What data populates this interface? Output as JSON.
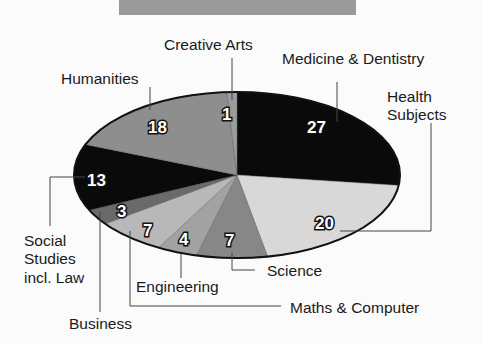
{
  "chart_data": {
    "type": "pie",
    "title": "",
    "units": "",
    "slices": [
      {
        "label": "Medicine & Dentistry",
        "value": 27,
        "color": "#0a0a0a"
      },
      {
        "label": "Health Subjects",
        "value": 20,
        "color": "#d8d8d8"
      },
      {
        "label": "Science",
        "value": 7,
        "color": "#878787"
      },
      {
        "label": "Engineering",
        "value": 4,
        "color": "#a2a2a2"
      },
      {
        "label": "Maths & Computer",
        "value": 7,
        "color": "#b8b8b8"
      },
      {
        "label": "Business",
        "value": 3,
        "color": "#6a6a6a"
      },
      {
        "label": "Social Studies incl. Law",
        "value": 13,
        "color": "#0a0a0a"
      },
      {
        "label": "Humanities",
        "value": 18,
        "color": "#8e8e8e"
      },
      {
        "label": "Creative Arts",
        "value": 1,
        "color": "#9c9c9c"
      }
    ],
    "legend": "leader-line labels"
  },
  "labels": {
    "creative_arts": "Creative Arts",
    "medicine": "Medicine & Dentistry",
    "humanities": "Humanities",
    "health_1": "Health",
    "health_2": "Subjects",
    "social_1": "Social",
    "social_2": "Studies",
    "social_3": "incl. Law",
    "business": "Business",
    "engineering": "Engineering",
    "science": "Science",
    "maths": "Maths & Computer"
  },
  "values": {
    "medicine": "27",
    "health": "20",
    "science": "7",
    "engineering": "4",
    "maths": "7",
    "business": "3",
    "social": "13",
    "humanities": "18",
    "creative_arts": "1"
  }
}
